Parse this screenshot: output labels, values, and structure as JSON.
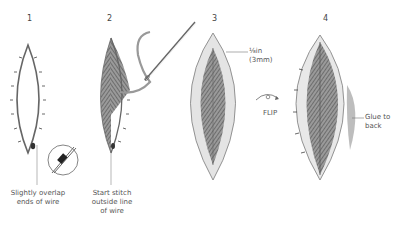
{
  "steps": [
    {
      "number": "1",
      "caption": [
        "Slightly overlap",
        "ends of wire"
      ]
    },
    {
      "number": "2",
      "caption": [
        "Start stitch",
        "outside line",
        "of wire"
      ]
    },
    {
      "number": "3",
      "caption": [
        "⅛in",
        "(3mm)"
      ]
    },
    {
      "number": "4",
      "caption": [
        "Glue to",
        "back"
      ]
    }
  ],
  "flip_label": "FLIP",
  "colors": {
    "wire": "#666666",
    "stitch_fill": "#7a7a7a",
    "fabric_margin": "#e6e6e6",
    "glue_shade": "#bdbdbd",
    "outline": "#8a8a8a"
  }
}
